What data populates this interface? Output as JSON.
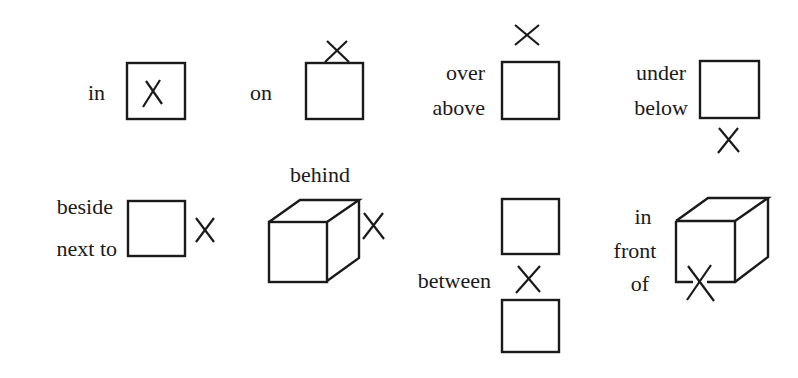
{
  "diagram": {
    "background": "#ffffff",
    "ink_color": "#1a1a1a",
    "items": [
      {
        "id": "in",
        "labels": [
          "in"
        ],
        "shape": "square",
        "marker_position": "inside square"
      },
      {
        "id": "on",
        "labels": [
          "on"
        ],
        "shape": "square",
        "marker_position": "on top edge of square"
      },
      {
        "id": "over-above",
        "labels": [
          "over",
          "above"
        ],
        "shape": "square",
        "marker_position": "above square"
      },
      {
        "id": "under-below",
        "labels": [
          "under",
          "below"
        ],
        "shape": "square",
        "marker_position": "below square"
      },
      {
        "id": "beside-next-to",
        "labels": [
          "beside",
          "next to"
        ],
        "shape": "square",
        "marker_position": "right of square"
      },
      {
        "id": "behind",
        "labels": [
          "behind"
        ],
        "shape": "cube",
        "marker_position": "behind cube (right side)"
      },
      {
        "id": "between",
        "labels": [
          "between"
        ],
        "shape": "two squares",
        "marker_position": "between two stacked squares"
      },
      {
        "id": "in-front-of",
        "labels": [
          "in",
          "front",
          "of"
        ],
        "shape": "cube",
        "marker_position": "in front of cube (bottom front edge)"
      }
    ]
  }
}
